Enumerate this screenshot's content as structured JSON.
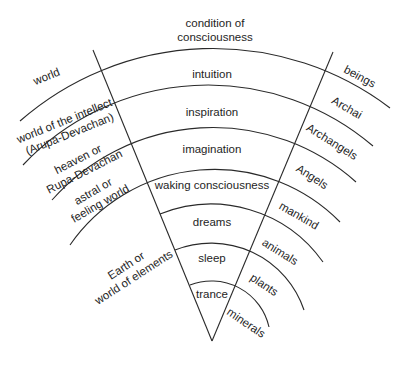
{
  "diagram": {
    "title_lines": [
      "condition of",
      "consciousness"
    ],
    "left_column_header": "world",
    "right_column_header": "beings",
    "levels": [
      {
        "world": [
          "world of the intellect",
          "(Arupa-Devachan)"
        ],
        "consciousness": "intuition",
        "beings": "Archai"
      },
      {
        "world": [
          "heaven or",
          "Rupa-Devachan"
        ],
        "consciousness": "inspiration",
        "beings": "Archangels"
      },
      {
        "world": [
          "astral or",
          "feeling world"
        ],
        "consciousness": "imagination",
        "beings": "Angels"
      },
      {
        "world": [
          "Earth or",
          "world of elements"
        ],
        "consciousness": "waking consciousness",
        "beings": "mankind"
      },
      {
        "world": [],
        "consciousness": "dreams",
        "beings": "animals"
      },
      {
        "world": [],
        "consciousness": "sleep",
        "beings": "plants"
      },
      {
        "world": [],
        "consciousness": "trance",
        "beings": "minerals"
      }
    ]
  }
}
